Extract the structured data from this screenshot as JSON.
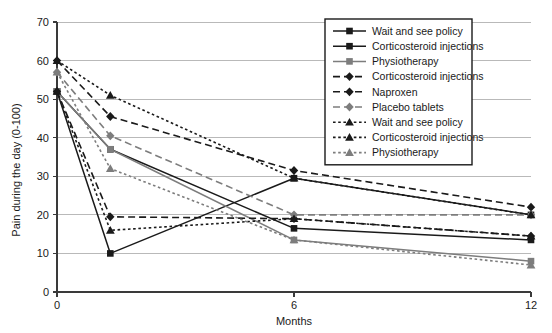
{
  "chart_data": {
    "type": "line",
    "title": "",
    "xlabel": "Months",
    "ylabel": "Pain during the day (0-100)",
    "x": [
      0,
      1.35,
      6,
      12
    ],
    "xticks": [
      0,
      6,
      12
    ],
    "xtick_labels": [
      "0",
      "6",
      "12"
    ],
    "xlim": [
      0,
      12
    ],
    "yticks": [
      0,
      10,
      20,
      30,
      40,
      50,
      60,
      70
    ],
    "ytick_labels": [
      "0",
      "10",
      "20",
      "30",
      "40",
      "50",
      "60",
      "70"
    ],
    "ylim": [
      0,
      70
    ],
    "grid": true,
    "legend_position": "upper-right",
    "series": [
      {
        "name": "Wait and see policy",
        "group": "solid",
        "style": "solid",
        "marker": "square",
        "color": "#1a1a1a",
        "values": [
          52,
          10,
          29.5,
          20
        ]
      },
      {
        "name": "Corticosteroid injections",
        "group": "solid",
        "style": "solid",
        "marker": "square",
        "color": "#1a1a1a",
        "values": [
          52,
          37,
          16.5,
          13.5
        ]
      },
      {
        "name": "Physiotherapy",
        "group": "solid",
        "style": "solid",
        "marker": "square",
        "color": "#7d7d7d",
        "values": [
          52,
          37,
          13.5,
          8
        ]
      },
      {
        "name": "Corticosteroid injections",
        "group": "dashed",
        "style": "dashed",
        "marker": "diamond",
        "color": "#1a1a1a",
        "values": [
          60,
          45.5,
          31.5,
          22
        ]
      },
      {
        "name": "Naproxen",
        "group": "dashed",
        "style": "dashed",
        "marker": "diamond",
        "color": "#1a1a1a",
        "values": [
          52,
          19.5,
          19,
          14.5
        ]
      },
      {
        "name": "Placebo tablets",
        "group": "dashed",
        "style": "dashed",
        "marker": "diamond",
        "color": "#7d7d7d",
        "values": [
          57,
          40.5,
          20,
          20
        ]
      },
      {
        "name": "Wait and see policy",
        "group": "dotted",
        "style": "dotted",
        "marker": "triangle",
        "color": "#1a1a1a",
        "values": [
          60,
          51,
          29.5,
          20
        ]
      },
      {
        "name": "Corticosteroid injections",
        "group": "dotted",
        "style": "dotted",
        "marker": "triangle",
        "color": "#1a1a1a",
        "values": [
          52,
          16,
          19,
          14.5
        ]
      },
      {
        "name": "Physiotherapy",
        "group": "dotted",
        "style": "dotted",
        "marker": "triangle",
        "color": "#7d7d7d",
        "values": [
          57,
          32,
          13.5,
          7
        ]
      }
    ]
  },
  "legend": {
    "items": [
      {
        "label": "Wait and see policy"
      },
      {
        "label": "Corticosteroid injections"
      },
      {
        "label": "Physiotherapy"
      },
      {
        "label": "Corticosteroid injections"
      },
      {
        "label": "Naproxen"
      },
      {
        "label": "Placebo tablets"
      },
      {
        "label": "Wait and see policy"
      },
      {
        "label": "Corticosteroid injections"
      },
      {
        "label": "Physiotherapy"
      }
    ]
  },
  "colors": {
    "black": "#1a1a1a",
    "gray": "#7d7d7d",
    "grid": "#b9b9b9",
    "axis": "#3a3a3a",
    "background": "#ffffff"
  }
}
